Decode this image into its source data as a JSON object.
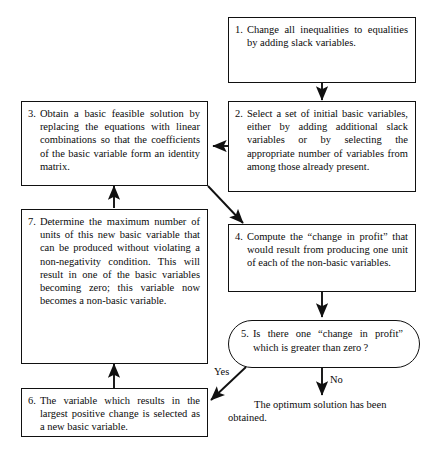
{
  "diagram": {
    "line_color": "#111111",
    "text_color": "#0b0b0b",
    "background": "#ffffff"
  },
  "nodes": {
    "step1": {
      "number": "1.",
      "text": "Change all inequalities to equalities by adding slack variables.",
      "shape": "rectangle"
    },
    "step2": {
      "number": "2.",
      "text": "Select a set of initial basic variables, either by adding additional slack variables or by selecting the appropriate number of variables from among those already present.",
      "shape": "rectangle"
    },
    "step3": {
      "number": "3.",
      "text": "Obtain a basic feasible solution by replacing the equations with linear combinations so that the coefficients of the basic variable form an identity matrix.",
      "shape": "rectangle"
    },
    "step4": {
      "number": "4.",
      "text": "Compute the “change in profit” that would result from producing one unit of each of the non-basic variables.",
      "shape": "rectangle"
    },
    "step5": {
      "number": "5.",
      "text": "Is there one “change in profit” which is greater than zero ?",
      "shape": "stadium"
    },
    "step6": {
      "number": "6.",
      "text": "The variable which results in the largest positive change is selected as a new basic variable.",
      "shape": "rectangle"
    },
    "step7": {
      "number": "7.",
      "text": "Determine the maximum number of units of this new basic variable that can be produced without violating a non-negativity condition. This will result in one of the basic variables becoming zero; this variable now becomes a non-basic variable.",
      "shape": "rectangle"
    }
  },
  "edge_labels": {
    "yes": "Yes",
    "no": "No"
  },
  "terminal": {
    "line1": "The optimum solution has been",
    "line2": "obtained."
  }
}
